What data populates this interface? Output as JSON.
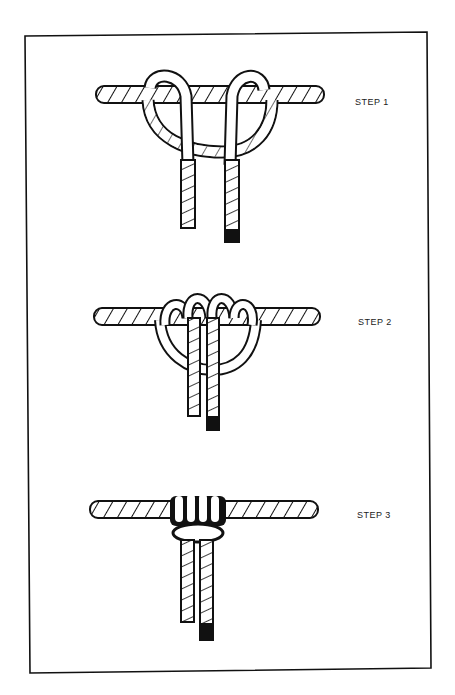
{
  "figure": {
    "steps": [
      {
        "label": "STEP 1",
        "x": 355,
        "y": 97
      },
      {
        "label": "STEP 2",
        "x": 358,
        "y": 317
      },
      {
        "label": "STEP 3",
        "x": 357,
        "y": 510
      }
    ],
    "colors": {
      "ink": "#111111",
      "paper": "#ffffff"
    }
  }
}
